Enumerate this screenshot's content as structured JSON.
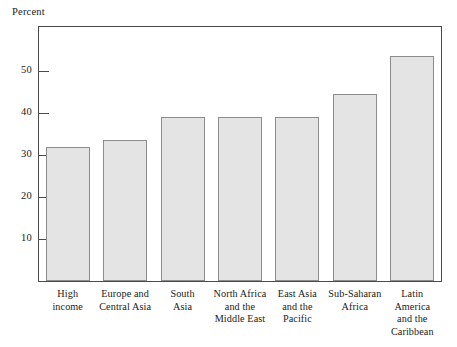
{
  "chart_data": {
    "type": "bar",
    "title": "",
    "subtitle": "",
    "xlabel": "",
    "ylabel": "Percent",
    "ylim": [
      0,
      60
    ],
    "yticks": [
      10,
      20,
      30,
      40,
      50
    ],
    "ytick_labels": [
      "10",
      "20",
      "30",
      "40",
      "50"
    ],
    "grid": false,
    "legend": null,
    "categories": [
      "High\nincome",
      "Europe and\nCentral Asia",
      "South\nAsia",
      "North Africa\nand the\nMiddle East",
      "East Asia\nand the\nPacific",
      "Sub-Saharan\nAfrica",
      "Latin\nAmerica\nand the\nCaribbean"
    ],
    "values": [
      32,
      33.5,
      39,
      39,
      39,
      44.5,
      53.5
    ],
    "bar_fill_color": "#e4e4e4",
    "bar_edge_color": "#8c8c8c",
    "axis_color": "#4a4a4a"
  }
}
